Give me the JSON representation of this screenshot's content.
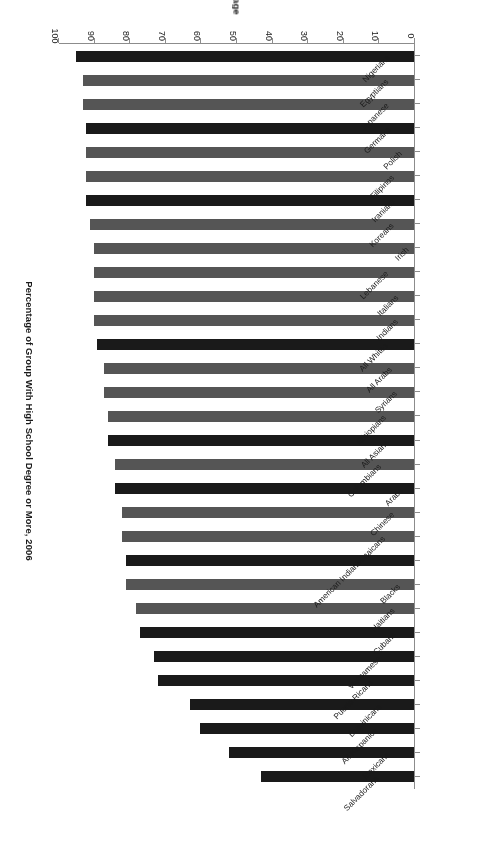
{
  "chart": {
    "title": "Percentage of Group With High School Degree or More, 2006",
    "value_axis_title": "Percentage",
    "value_ticks": [
      "0",
      "10",
      "20",
      "30",
      "40",
      "50",
      "60",
      "70",
      "80",
      "90",
      "100"
    ]
  },
  "chart_data": {
    "type": "bar",
    "orientation": "horizontal",
    "title": "Percentage of Group With High School Degree or More, 2006",
    "xlabel": "Percentage",
    "ylabel": "",
    "xlim": [
      0,
      100
    ],
    "grid": false,
    "legend": "none",
    "categories": [
      "Nigerians",
      "Egyptians",
      "Japanese",
      "Germans",
      "Polish",
      "Filipinos",
      "Iranians",
      "Koreans",
      "Irish",
      "Lebanese",
      "Italians",
      "Indians",
      "All Whites",
      "All Arabs",
      "Syrians",
      "Ethiopians",
      "All Asians",
      "Colombians",
      "Arabs",
      "Chinese",
      "Jamaicans",
      "American Indians",
      "Blacks",
      "Haitians",
      "Cubans",
      "Vietnamese",
      "Puerto Ricans",
      "Dominicans",
      "All Hispanics",
      "Mexicans",
      "Salvadorans"
    ],
    "values": [
      95,
      93,
      93,
      92,
      92,
      92,
      92,
      91,
      90,
      90,
      90,
      90,
      89,
      87,
      87,
      86,
      86,
      84,
      84,
      82,
      82,
      81,
      81,
      78,
      77,
      73,
      72,
      63,
      60,
      52,
      43
    ],
    "bar_styles": [
      "dark",
      "medium",
      "medium",
      "dark",
      "medium",
      "medium",
      "dark",
      "medium",
      "medium",
      "hatch-medium",
      "hatch-medium",
      "medium",
      "dark",
      "medium",
      "medium",
      "hatch-medium",
      "dark",
      "medium",
      "dark",
      "medium",
      "medium",
      "dark",
      "medium",
      "medium",
      "dark",
      "dark",
      "dark",
      "dark",
      "hatch-dark",
      "dark",
      "dark"
    ],
    "colors": {
      "dark": "#1a1a1a",
      "medium": "#555555",
      "hatch-medium": "#555555",
      "hatch-dark": "#1a1a1a",
      "axis": "#8c8c8c",
      "text": "#1a1a1a",
      "background": "#ffffff"
    }
  }
}
